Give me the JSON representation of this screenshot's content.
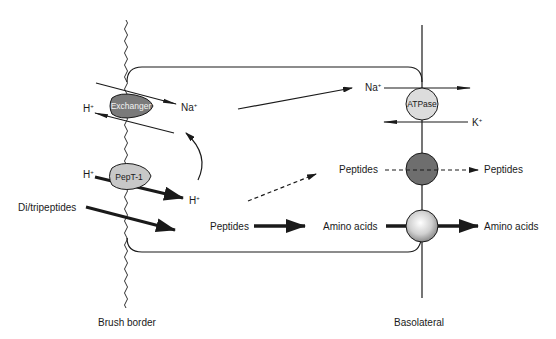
{
  "diagram": {
    "type": "cell transport diagram (intestinal enterocyte peptide absorption)",
    "membranes": {
      "apical_label": "Brush border",
      "basolateral_label": "Basolateral"
    },
    "transporters": {
      "exchanger": {
        "label": "Exchanger",
        "color": "#7a7a7a"
      },
      "pept1": {
        "label": "PepT-1",
        "color": "#c8c8c8"
      },
      "atpase": {
        "label": "ATPase",
        "color": "#dcdcdc"
      },
      "peptide_transporter": {
        "label": "",
        "color": "#6e6e6e"
      },
      "amino_acid_transporter": {
        "label": "",
        "color": "#d8d8d8"
      }
    },
    "labels": {
      "exchanger_h": "H",
      "exchanger_h_sup": "+",
      "exchanger_na": "Na",
      "exchanger_na_sup": "+",
      "pept1_h_in": "H",
      "pept1_h_in_sup": "+",
      "pept1_h_out": "H",
      "pept1_h_out_sup": "+",
      "ditripeptides": "Di/tripeptides",
      "cell_peptides": "Peptides",
      "atpase_na": "Na",
      "atpase_na_sup": "+",
      "atpase_k": "K",
      "atpase_k_sup": "+",
      "baso_peptides_in": "Peptides",
      "baso_peptides_out": "Peptides",
      "amino_acids_in": "Amino acids",
      "amino_acids_out": "Amino acids"
    },
    "colors": {
      "line": "#1a1a1a",
      "background": "#ffffff"
    }
  }
}
